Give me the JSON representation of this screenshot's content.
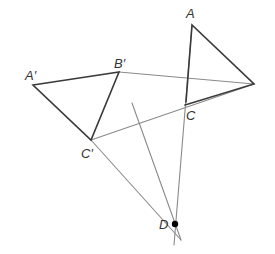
{
  "diagram": {
    "title": "",
    "points": {
      "A": "A",
      "B": "",
      "C": "C",
      "A_prime": "A′",
      "B_prime": "B′",
      "C_prime": "C′",
      "D": "D"
    },
    "triangles": [
      {
        "name": "ABC",
        "vertices": [
          "A",
          "B",
          "C"
        ],
        "style": "dark"
      },
      {
        "name": "A'B'C'",
        "vertices": [
          "A′",
          "B′",
          "C′"
        ],
        "style": "dark"
      }
    ],
    "construction_lines": [
      {
        "from": "B′",
        "to": "B",
        "style": "light"
      },
      {
        "from": "C′",
        "to": "B",
        "style": "light"
      },
      {
        "from": "A",
        "to": "D",
        "style": "light",
        "extends_past": "D"
      },
      {
        "from": "C′",
        "to": "D",
        "style": "light",
        "extends_past": "D"
      },
      {
        "from": "bisector-start",
        "to": "D",
        "style": "light",
        "extends_past": "D"
      }
    ],
    "center_point": "D",
    "colors": {
      "dark_line": "#3a3a3a",
      "light_line": "#8a8a8a",
      "point": "#000000",
      "label": "#333333"
    }
  }
}
